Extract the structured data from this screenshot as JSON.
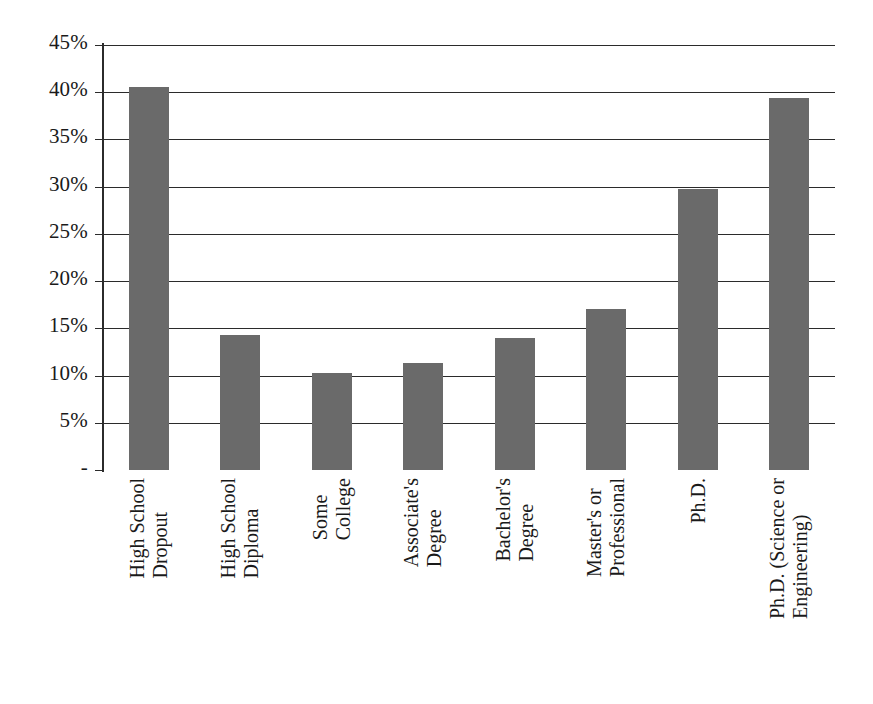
{
  "chart_data": {
    "type": "bar",
    "title": "",
    "subtitle": "",
    "xlabel": "",
    "ylabel": "",
    "categories": [
      "High School Dropout",
      "High School Diploma",
      "Some College",
      "Associate's Degree",
      "Bachelor's Degree",
      "Master's or Professional",
      "Ph.D.",
      "Ph.D. (Science or Engineering)"
    ],
    "category_lines": [
      [
        "High School",
        "Dropout"
      ],
      [
        "High School",
        "Diploma"
      ],
      [
        "Some",
        "College"
      ],
      [
        "Associate's",
        "Degree"
      ],
      [
        "Bachelor's",
        "Degree"
      ],
      [
        "Master's or",
        "Professional"
      ],
      [
        "Ph.D."
      ],
      [
        "Ph.D. (Science or",
        "Engineering)"
      ]
    ],
    "values": [
      40.6,
      14.3,
      10.3,
      11.3,
      14.0,
      17.0,
      29.8,
      39.4
    ],
    "value_labels": [
      "40.6%",
      "14.3%",
      "10.3%",
      "11.3%",
      "14.0%",
      "17.0%",
      "29.8%",
      "39.4%"
    ],
    "ylim": [
      0,
      45
    ],
    "ytick_values": [
      0,
      5,
      10,
      15,
      20,
      25,
      30,
      35,
      40,
      45
    ],
    "ytick_labels": [
      "-",
      "5%",
      "10%",
      "15%",
      "20%",
      "25%",
      "30%",
      "35%",
      "40%",
      "45%"
    ],
    "grid": true,
    "grid_axis": "y",
    "legend": false,
    "legend_position": "none",
    "series": [
      {
        "name": "",
        "values": [
          40.6,
          14.3,
          10.3,
          11.3,
          14.0,
          17.0,
          29.8,
          39.4
        ],
        "color": "#6a6a6a"
      }
    ]
  },
  "style": {
    "bar_color": "#6a6a6a",
    "axis_color": "#2b2b2b",
    "grid_color": "#2b2b2b",
    "background": "#ffffff",
    "text_color": "#1a1a1a"
  }
}
